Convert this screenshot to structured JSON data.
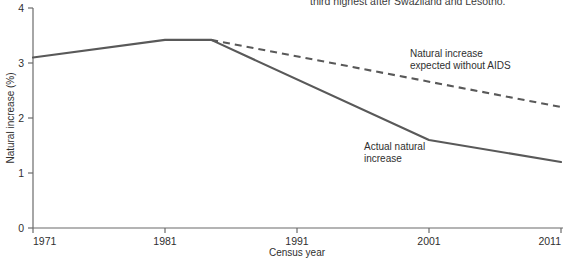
{
  "caption": {
    "trailing_line": "third highest after Swaziland and Lesotho."
  },
  "chart_data": {
    "type": "line",
    "title": "",
    "xlabel": "Census year",
    "ylabel": "Natural increase (%)",
    "xlim": [
      1971,
      2011
    ],
    "ylim": [
      0,
      4
    ],
    "xticks": [
      "1971",
      "1981",
      "1991",
      "2001",
      "2011"
    ],
    "yticks": [
      "0",
      "1",
      "2",
      "3",
      "4"
    ],
    "grid": false,
    "legend": "none (inline annotations)",
    "series": [
      {
        "name": "Actual natural increase",
        "style": "solid",
        "color": "#595959",
        "x": [
          1971,
          1981,
          1984.5,
          2001,
          2011
        ],
        "values": [
          3.1,
          3.42,
          3.42,
          1.6,
          1.2
        ]
      },
      {
        "name": "Natural increase expected without AIDS",
        "style": "dashed",
        "color": "#595959",
        "x": [
          1984.5,
          2011
        ],
        "values": [
          3.42,
          2.2
        ]
      }
    ],
    "annotations": [
      {
        "id": "expected-label",
        "text_line1": "Natural increase",
        "text_line2": "expected without AIDS",
        "x": 2001,
        "y": 2.9
      },
      {
        "id": "actual-label",
        "text_line1": "Actual natural",
        "text_line2": "increase",
        "x": 1998,
        "y": 1.55
      }
    ]
  }
}
